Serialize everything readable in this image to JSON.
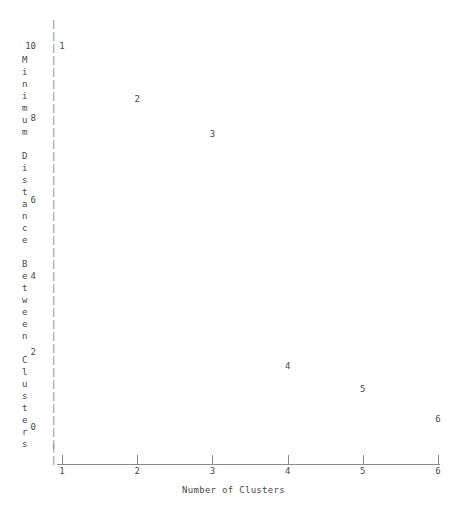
{
  "chart_data": {
    "type": "scatter",
    "title": "",
    "xlabel": "Number of Clusters",
    "ylabel": "Minimum Distance Between Clusters",
    "ylabel_chars": [
      "M",
      "i",
      "n",
      "i",
      "m",
      "u",
      "m",
      " ",
      "D",
      "i",
      "s",
      "t",
      "a",
      "n",
      "c",
      "e",
      " ",
      "B",
      "e",
      "t",
      "w",
      "e",
      "e",
      "n",
      " ",
      "C",
      "l",
      "u",
      "s",
      "t",
      "e",
      "r",
      "s"
    ],
    "x": [
      1,
      2,
      3,
      4,
      5,
      6
    ],
    "y": [
      10.0,
      8.6,
      7.7,
      1.6,
      1.0,
      0.2
    ],
    "point_labels": [
      "1",
      "2",
      "3",
      "4",
      "5",
      "6"
    ],
    "categories": [
      "1",
      "2",
      "3",
      "4",
      "5",
      "6"
    ],
    "xticks": [
      "1",
      "2",
      "3",
      "4",
      "5",
      "6"
    ],
    "yticks": [
      "10",
      "8",
      "6",
      "4",
      "2",
      "0"
    ],
    "xlim": [
      1,
      6
    ],
    "ylim": [
      0,
      10
    ],
    "grid": false,
    "legend": null,
    "marker_style": "numeric-label",
    "axis_style": "ascii",
    "axis_color": "#8a8a8a",
    "text_color": "#4a4a4a",
    "background_color": "#ffffff"
  },
  "axis": {
    "y_tick_values": [
      "10",
      "8",
      "6",
      "4",
      "2",
      "0"
    ],
    "x_tick_values": [
      "1",
      "2",
      "3",
      "4",
      "5",
      "6"
    ],
    "y_bar_glyph": "|",
    "x_axis_glyph": "_"
  },
  "points": [
    {
      "label": "1",
      "x": 1,
      "y": 10.0
    },
    {
      "label": "2",
      "x": 2,
      "y": 8.6
    },
    {
      "label": "3",
      "x": 3,
      "y": 7.7
    },
    {
      "label": "4",
      "x": 4,
      "y": 1.6
    },
    {
      "label": "5",
      "x": 5,
      "y": 1.0
    },
    {
      "label": "6",
      "x": 6,
      "y": 0.2
    }
  ]
}
